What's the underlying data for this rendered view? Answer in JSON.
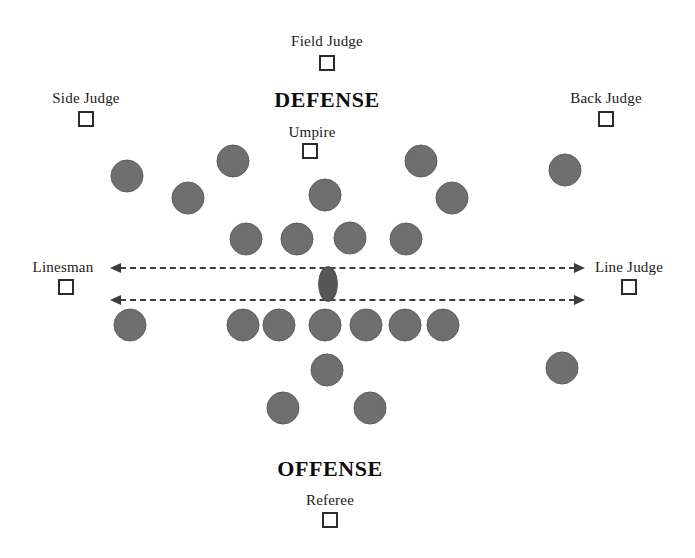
{
  "diagram": {
    "title_defense": "DEFENSE",
    "title_offense": "OFFENSE",
    "colors": {
      "player_fill": "#6f6f6f",
      "player_edge": "#5d5d5d",
      "ball_fill": "#565656",
      "line": "#3c3c3c",
      "text": "#1a1a1a"
    }
  },
  "titles": [
    {
      "text": "DEFENSE",
      "x": 327,
      "y": 87,
      "name": "defense-title"
    },
    {
      "text": "OFFENSE",
      "x": 330,
      "y": 456,
      "name": "offense-title"
    }
  ],
  "officials": [
    {
      "label": "Field Judge",
      "name": "field-judge",
      "label_x": 327,
      "label_y": 33,
      "box_x": 327,
      "box_y": 55
    },
    {
      "label": "Side Judge",
      "name": "side-judge",
      "label_x": 86,
      "label_y": 90,
      "box_x": 86,
      "box_y": 111
    },
    {
      "label": "Back Judge",
      "name": "back-judge",
      "label_x": 606,
      "label_y": 90,
      "box_x": 606,
      "box_y": 111
    },
    {
      "label": "Umpire",
      "name": "umpire",
      "label_x": 312,
      "label_y": 124,
      "box_x": 310,
      "box_y": 143
    },
    {
      "label": "Linesman",
      "name": "linesman",
      "label_x": 63,
      "label_y": 259,
      "box_x": 66,
      "box_y": 279
    },
    {
      "label": "Line Judge",
      "name": "line-judge",
      "label_x": 629,
      "label_y": 259,
      "box_x": 629,
      "box_y": 279
    },
    {
      "label": "Referee",
      "name": "referee",
      "label_x": 330,
      "label_y": 492,
      "box_x": 330,
      "box_y": 512
    }
  ],
  "scrimmage_lines": [
    {
      "name": "upper-scrimmage-line",
      "x1": 110,
      "x2": 585,
      "y": 268
    },
    {
      "name": "lower-scrimmage-line",
      "x1": 110,
      "x2": 585,
      "y": 300
    }
  ],
  "ball": {
    "name": "football",
    "x": 328,
    "y": 284
  },
  "defense_players": [
    {
      "name": "defense-left-corner",
      "x": 127,
      "y": 176
    },
    {
      "name": "defense-left-end",
      "x": 233,
      "y": 161
    },
    {
      "name": "defense-left-safety",
      "x": 188,
      "y": 198
    },
    {
      "name": "defense-middle-back",
      "x": 325,
      "y": 195
    },
    {
      "name": "defense-right-end",
      "x": 421,
      "y": 161
    },
    {
      "name": "defense-right-safety",
      "x": 452,
      "y": 198
    },
    {
      "name": "defense-right-corner",
      "x": 565,
      "y": 170
    },
    {
      "name": "defense-line-1",
      "x": 246,
      "y": 239
    },
    {
      "name": "defense-line-2",
      "x": 297,
      "y": 239
    },
    {
      "name": "defense-line-3",
      "x": 350,
      "y": 238
    },
    {
      "name": "defense-line-4",
      "x": 406,
      "y": 239
    }
  ],
  "offense_players": [
    {
      "name": "offense-split-end-left",
      "x": 130,
      "y": 325
    },
    {
      "name": "offense-line-1",
      "x": 243,
      "y": 325
    },
    {
      "name": "offense-line-2",
      "x": 279,
      "y": 325
    },
    {
      "name": "offense-center",
      "x": 325,
      "y": 325
    },
    {
      "name": "offense-line-3",
      "x": 366,
      "y": 325
    },
    {
      "name": "offense-line-4",
      "x": 405,
      "y": 325
    },
    {
      "name": "offense-line-5",
      "x": 443,
      "y": 325
    },
    {
      "name": "offense-quarterback",
      "x": 327,
      "y": 370
    },
    {
      "name": "offense-flanker-right",
      "x": 562,
      "y": 368
    },
    {
      "name": "offense-back-left",
      "x": 283,
      "y": 408
    },
    {
      "name": "offense-back-right",
      "x": 370,
      "y": 408
    }
  ]
}
